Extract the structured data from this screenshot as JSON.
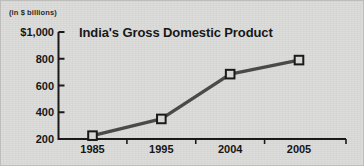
{
  "chart_data": {
    "type": "line",
    "title": "India's Gross Domestic Product",
    "axis_note": "(in $ billions)",
    "xlabel": "",
    "ylabel": "",
    "categories": [
      "1985",
      "1995",
      "2004",
      "2005"
    ],
    "values": [
      225,
      350,
      685,
      790
    ],
    "ytick_labels": [
      "$1,000",
      "800",
      "600",
      "400",
      "200"
    ],
    "ytick_values": [
      1000,
      800,
      600,
      400,
      200
    ],
    "ylim": [
      200,
      1000
    ],
    "grid": false,
    "legend": null,
    "series": [
      {
        "name": "India's Gross Domestic Product",
        "values": [
          225,
          350,
          685,
          790
        ]
      }
    ],
    "marker": "square",
    "line_color": "#4a4a4a",
    "marker_fill": "#d7d7d5",
    "marker_edge": "#1a1a1a",
    "axis_color": "#1a1a1a",
    "background_color": "#dadad8",
    "text_color": "#161616"
  }
}
